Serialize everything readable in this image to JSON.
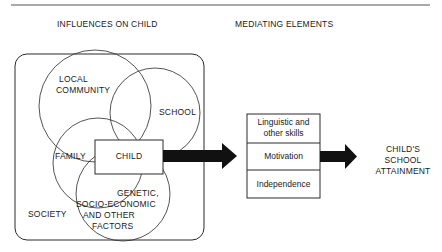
{
  "diagram": {
    "headers": {
      "influences": "INFLUENCES ON CHILD",
      "mediating": "MEDIATING ELEMENTS"
    },
    "influences": {
      "container_label": "SOCIETY",
      "circles": [
        {
          "id": "local-community",
          "label_line1": "LOCAL",
          "label_line2": "COMMUNITY"
        },
        {
          "id": "school",
          "label": "SCHOOL"
        },
        {
          "id": "family",
          "label": "FAMILY"
        },
        {
          "id": "genetic",
          "label_line1": "GENETIC,",
          "label_line2": "SOCIO-ECONOMIC",
          "label_line3": "AND OTHER",
          "label_line4": "FACTORS"
        }
      ],
      "center_box": "CHILD"
    },
    "mediating_elements": [
      {
        "line1": "Linguistic and",
        "line2": "other skills"
      },
      {
        "line1": "Motivation"
      },
      {
        "line1": "Independence"
      }
    ],
    "outcome": {
      "line1": "CHILD'S",
      "line2": "SCHOOL",
      "line3": "ATTAINMENT"
    },
    "colors": {
      "stroke": "#2a2a2a",
      "arrow": "#111111",
      "background": "#ffffff"
    }
  }
}
